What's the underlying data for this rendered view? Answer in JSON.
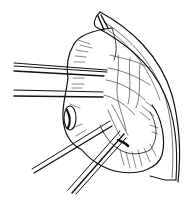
{
  "figure": {
    "colors": {
      "background": "#ffffff",
      "ink": "#111111"
    },
    "elements": [
      {
        "name": "peritoneal-flap"
      },
      {
        "name": "bowel-loop"
      },
      {
        "name": "mesentery"
      },
      {
        "name": "bowel-opening"
      },
      {
        "name": "forceps-horizontal-upper"
      },
      {
        "name": "forceps-horizontal-lower"
      },
      {
        "name": "forceps-diagonal-left"
      },
      {
        "name": "forceps-diagonal-right"
      }
    ]
  }
}
